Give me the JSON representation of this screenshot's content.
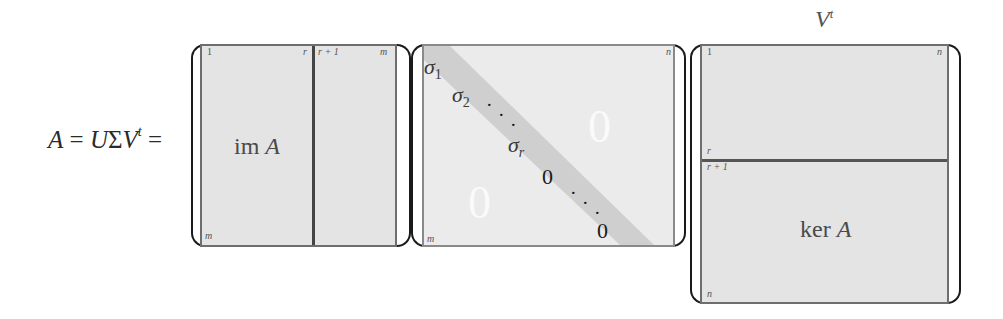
{
  "equation": {
    "lhs": "A",
    "equals": "=",
    "U": "U",
    "Sigma": "Σ",
    "V": "V",
    "transpose": "t",
    "equals2": "="
  },
  "matrix_u": {
    "col_start": "1",
    "col_r": "r",
    "col_r1": "r + 1",
    "col_end": "m",
    "row_end": "m",
    "block_label_prefix": "im",
    "block_label_var": "A"
  },
  "matrix_sigma": {
    "col_end": "n",
    "row_end": "m",
    "sigma": "σ",
    "sigma1_sub": "1",
    "sigma2_sub": "2",
    "sigmar_sub": "r",
    "diag_dots": "· · ·",
    "diag_zero_1": "0",
    "diag_zero_2": "0",
    "upper_zero": "0",
    "lower_zero": "0"
  },
  "matrix_v": {
    "title": "V",
    "title_sup": "t",
    "row_start": "1",
    "col_end": "n",
    "row_r": "r",
    "row_r1": "r + 1",
    "row_end": "n",
    "block_label_prefix": "ker",
    "block_label_var": "A"
  },
  "colors": {
    "matrix_fill": "#e4e4e4",
    "diagonal_band": "#cfcfcf",
    "border": "#6e6e6e"
  }
}
